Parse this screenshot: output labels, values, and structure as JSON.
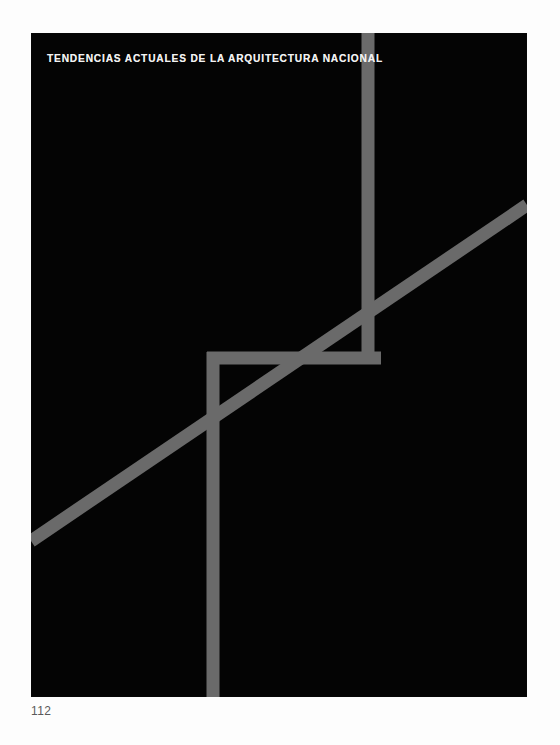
{
  "page": {
    "background_color": "#fdfdfd",
    "width": 560,
    "height": 745,
    "folio": "112"
  },
  "plate": {
    "name": "architecture-poster-plate",
    "background_color": "#040404",
    "x": 31,
    "y": 33,
    "width": 496,
    "height": 664,
    "title": "TENDENCIAS ACTUALES DE LA ARQUITECTURA NACIONAL",
    "title_color": "#f2f2f2"
  },
  "artwork": {
    "stroke_color": "#6a6a6a",
    "stroke_width": 13,
    "description": "Abstract geometric line composition of intersecting gray bars on black",
    "elements": [
      {
        "name": "upper-vertical-bar",
        "type": "line",
        "x1": 337,
        "y1": 0,
        "x2": 337,
        "y2": 325
      },
      {
        "name": "horizontal-bar",
        "type": "line",
        "x1": 182,
        "y1": 325,
        "x2": 347,
        "y2": 325
      },
      {
        "name": "lower-vertical-bar",
        "type": "line",
        "x1": 182,
        "y1": 325,
        "x2": 182,
        "y2": 664
      },
      {
        "name": "rising-diagonal-bar",
        "type": "line",
        "x1": 0,
        "y1": 508,
        "x2": 496,
        "y2": 172
      }
    ]
  }
}
